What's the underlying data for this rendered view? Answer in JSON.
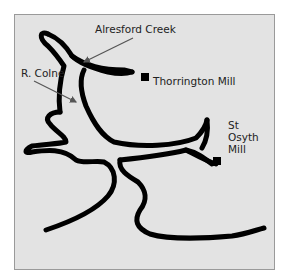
{
  "map": {
    "title": "",
    "labels": {
      "alresford_creek": "Alresford Creek",
      "r_colne": "R. Colne",
      "thorrington_mill": "Thorrington Mill",
      "st_osyth_mill": "St Osyth Mill"
    },
    "markers": [
      {
        "name": "Thorrington Mill",
        "symbol": "black-square"
      },
      {
        "name": "St Osyth Mill",
        "symbol": "black-square"
      }
    ],
    "colors": {
      "background": "#e3e3e3",
      "river_line": "#000000",
      "text": "#222222",
      "pointer_arrow": "#555555",
      "frame_border": "#9a9a9a"
    }
  }
}
